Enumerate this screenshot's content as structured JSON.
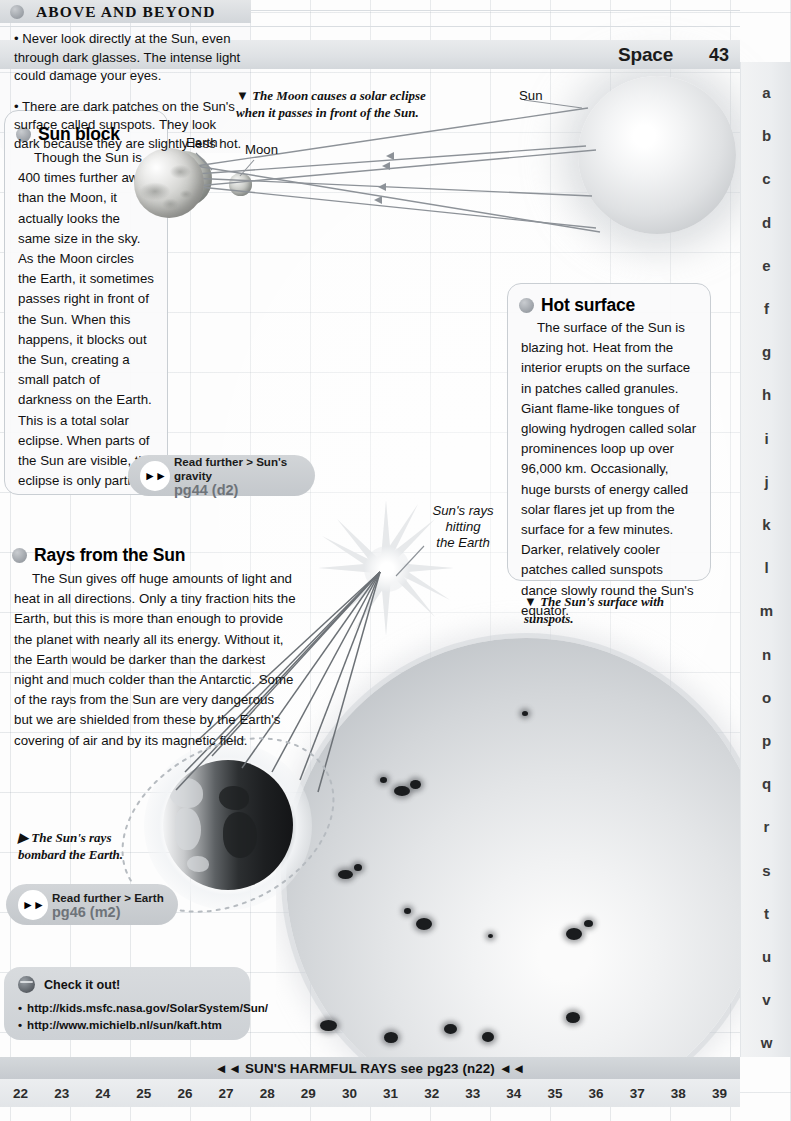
{
  "header": {
    "title": "Space",
    "page_number": "43"
  },
  "alphabet_rail": [
    "a",
    "b",
    "c",
    "d",
    "e",
    "f",
    "g",
    "h",
    "i",
    "j",
    "k",
    "l",
    "m",
    "n",
    "o",
    "p",
    "q",
    "r",
    "s",
    "t",
    "u",
    "v",
    "w"
  ],
  "eclipse_diagram": {
    "caption": "The Moon causes a solar eclipse when it passes in front of the Sun.",
    "caption_marker": "▼",
    "labels": {
      "earth": "Earth",
      "moon": "Moon",
      "sun": "Sun"
    }
  },
  "sun_block_panel": {
    "title": "Sun block",
    "body": "Though the Sun is 400 times further away than the Moon, it actually looks the same size in the sky. As the Moon circles the Earth, it sometimes passes right in front of the Sun. When this happens, it blocks out the Sun, creating a small patch of darkness on the Earth. This is a total solar eclipse. When parts of the Sun are visible, the eclipse is only partial."
  },
  "above_and_beyond": {
    "title": "ABOVE AND BEYOND",
    "items": [
      "• Never look directly at the Sun, even through dark glasses. The intense light could damage your eyes.",
      "• There are dark patches on the Sun's surface called sunspots. They look dark because they are slightly less hot."
    ]
  },
  "hot_surface_panel": {
    "title": "Hot surface",
    "body": "The surface of the Sun is blazing hot. Heat from the interior erupts on the surface in patches called granules. Giant flame-like tongues of glowing hydrogen called solar prominences loop up over 96,000 km. Occasionally, huge bursts of energy called solar flares jet up from the surface for a few minutes. Darker, relatively cooler patches called sunspots dance slowly round the Sun's equator.",
    "caption": "The Sun's surface with sunspots.",
    "caption_marker": "▼"
  },
  "rays_section": {
    "title": "Rays from the Sun",
    "body": "The Sun gives off huge amounts of light and heat in all directions. Only a tiny fraction hits the Earth, but this is more than enough to provide the planet with nearly all its energy. Without it, the Earth would be darker than the darkest night and much colder than the Antarctic. Some of the rays from the Sun are very dangerous but we are shielded from these by the Earth's covering of air and by its magnetic field.",
    "ray_label": "Sun's rays\nhitting\nthe Earth",
    "ray_label_lines": [
      "Sun's rays",
      "hitting",
      "the Earth"
    ],
    "caption": "The Sun's rays bombard the Earth.",
    "caption_marker": "▶"
  },
  "read_further": [
    {
      "top": "Read further > Sun's gravity",
      "bottom": "pg44 (d2)",
      "arrows": "►►"
    },
    {
      "top": "Read further > Earth",
      "bottom": "pg46 (m2)",
      "arrows": "►►"
    }
  ],
  "check_it_out": {
    "title": "Check it out!",
    "icon": "globe-icon",
    "links": [
      "http://kids.msfc.nasa.gov/SolarSystem/Sun/",
      "http://www.michielb.nl/sun/kaft.htm"
    ],
    "bullet": "•"
  },
  "footer": {
    "text": "◄◄ SUN'S HARMFUL RAYS see pg23 (n22) ◄◄",
    "page_numbers": [
      "22",
      "23",
      "24",
      "25",
      "26",
      "27",
      "28",
      "29",
      "30",
      "31",
      "32",
      "33",
      "34",
      "35",
      "36",
      "37",
      "38",
      "39"
    ]
  },
  "colors": {
    "page_background": "#fdfdfd",
    "grid_line": "#96a0aa",
    "band_gray": "#d4d8db",
    "panel_border": "#c9ced3",
    "text": "#111111",
    "muted_text": "#6e7379"
  }
}
